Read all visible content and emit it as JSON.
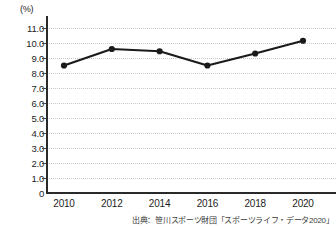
{
  "chart_data": {
    "type": "line",
    "title": "",
    "subtitle": "",
    "xlabel": "",
    "ylabel": "",
    "unit_label": "(%)",
    "categories": [
      "2010",
      "2012",
      "2014",
      "2016",
      "2018",
      "2020"
    ],
    "x": [
      2010,
      2012,
      2014,
      2016,
      2018,
      2020
    ],
    "values": [
      8.5,
      9.6,
      9.45,
      8.5,
      9.3,
      10.15
    ],
    "series": [
      {
        "name": "",
        "values": [
          8.5,
          9.6,
          9.45,
          8.5,
          9.3,
          10.15
        ]
      }
    ],
    "ylim": [
      0,
      11.5
    ],
    "ytick_labels": [
      "11.0",
      "10.0",
      "9.0",
      "8.0",
      "7.0",
      "6.0",
      "5.0",
      "4.0",
      "3.0",
      "2.0",
      "1.0",
      "0"
    ],
    "ytick_values": [
      11.0,
      10.0,
      9.0,
      8.0,
      7.0,
      6.0,
      5.0,
      4.0,
      3.0,
      2.0,
      1.0,
      0
    ],
    "grid": true,
    "grid_style": "dotted",
    "legend": "none",
    "line_color": "#1a1a1a",
    "marker": "circle",
    "marker_color": "#1a1a1a",
    "axis_color": "#2a2a2a",
    "grid_color": "#c9c9c9",
    "background": "#ffffff"
  },
  "footer": {
    "source_note": "出典：笹川スポーツ財団「スポーツライフ・データ2020」"
  }
}
